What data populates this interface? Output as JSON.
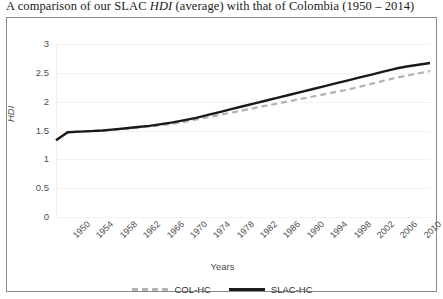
{
  "title": {
    "before_italic": "A comparison of our SLAC ",
    "italic": "HDI",
    "after_italic": " (average) with that of Colombia (1950 – 2014)"
  },
  "axes": {
    "ylabel": "HDI",
    "xlabel": "Years",
    "yticks": [
      "0",
      "0.5",
      "1",
      "1.5",
      "2",
      "2.5",
      "3"
    ],
    "xticks": [
      "1950",
      "1954",
      "1958",
      "1962",
      "1966",
      "1970",
      "1974",
      "1978",
      "1982",
      "1986",
      "1990",
      "1994",
      "1998",
      "2002",
      "2006",
      "2010",
      "2014"
    ]
  },
  "legend": {
    "items": [
      {
        "label": "COL-HC",
        "style": "dashed",
        "color": "#b3b3b3"
      },
      {
        "label": "SLAC-HC",
        "style": "solid",
        "color": "#1a1a1a"
      }
    ]
  },
  "colors": {
    "col_hc": "#b3b3b3",
    "slac_hc": "#1a1a1a",
    "grid": "#f2f2f2",
    "frame": "#8a8a8a",
    "text": "#4d4d4d"
  },
  "chart_data": {
    "type": "line",
    "title": "A comparison of our SLAC HDI (average) with that of Colombia (1950 – 2014)",
    "xlabel": "Years",
    "ylabel": "HDI",
    "ylim": [
      0,
      3
    ],
    "ytick_step": 0.5,
    "grid": true,
    "legend_position": "bottom",
    "x": [
      1950,
      1952,
      1954,
      1956,
      1958,
      1960,
      1962,
      1964,
      1966,
      1968,
      1970,
      1972,
      1974,
      1976,
      1978,
      1980,
      1982,
      1984,
      1986,
      1988,
      1990,
      1992,
      1994,
      1996,
      1998,
      2000,
      2002,
      2004,
      2006,
      2008,
      2010,
      2012,
      2014
    ],
    "series": [
      {
        "name": "COL-HC",
        "style": "dashed",
        "color": "#b3b3b3",
        "values": [
          1.33,
          1.47,
          1.48,
          1.49,
          1.5,
          1.51,
          1.53,
          1.55,
          1.57,
          1.59,
          1.62,
          1.65,
          1.69,
          1.73,
          1.77,
          1.81,
          1.85,
          1.89,
          1.93,
          1.97,
          2.01,
          2.05,
          2.09,
          2.13,
          2.17,
          2.21,
          2.26,
          2.31,
          2.36,
          2.41,
          2.45,
          2.49,
          2.53
        ]
      },
      {
        "name": "SLAC-HC",
        "style": "solid",
        "color": "#1a1a1a",
        "values": [
          1.33,
          1.47,
          1.48,
          1.49,
          1.5,
          1.52,
          1.54,
          1.56,
          1.58,
          1.61,
          1.64,
          1.68,
          1.72,
          1.77,
          1.82,
          1.87,
          1.92,
          1.97,
          2.02,
          2.07,
          2.12,
          2.17,
          2.22,
          2.27,
          2.32,
          2.37,
          2.42,
          2.47,
          2.52,
          2.57,
          2.61,
          2.64,
          2.67
        ]
      }
    ]
  }
}
